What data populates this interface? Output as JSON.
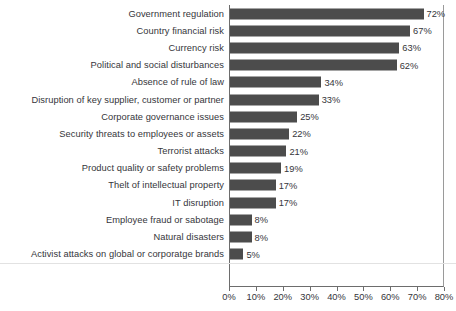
{
  "chart_data": {
    "type": "bar",
    "orientation": "horizontal",
    "title": "",
    "subtitle": "",
    "xlabel": "",
    "ylabel": "",
    "xlim": [
      0,
      80
    ],
    "xtick_step": 10,
    "grid": false,
    "legend": null,
    "value_label_suffix": "%",
    "bar_color": "#4c4c4c",
    "text_color": "#35353a",
    "axis_color": "#6d6d6d",
    "tick_labels": [
      "0%",
      "10%",
      "20%",
      "30%",
      "40%",
      "50%",
      "60%",
      "70%",
      "80%"
    ],
    "tick_values": [
      0,
      10,
      20,
      30,
      40,
      50,
      60,
      70,
      80
    ],
    "categories": [
      "Government regulation",
      "Country financial risk",
      "Currency risk",
      "Political and social disturbances",
      "Absence of rule of law",
      "Disruption of key supplier, customer or partner",
      "Corporate governance issues",
      "Security threats to employees or assets",
      "Terrorist attacks",
      "Product quality or safety problems",
      "Thelt of intellectual property",
      "IT disruption",
      "Employee fraud or sabotage",
      "Natural disasters",
      "Activist attacks on global or corporatge brands"
    ],
    "values": [
      72,
      67,
      63,
      62,
      34,
      33,
      25,
      22,
      21,
      19,
      17,
      17,
      8,
      8,
      5
    ],
    "value_labels": [
      "72%",
      "67%",
      "63%",
      "62%",
      "34%",
      "33%",
      "25%",
      "22%",
      "21%",
      "19%",
      "17%",
      "17%",
      "8%",
      "8%",
      "5%"
    ]
  }
}
